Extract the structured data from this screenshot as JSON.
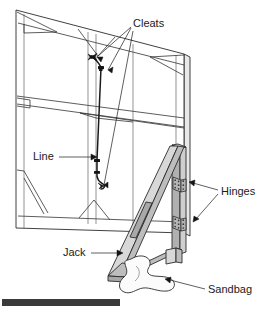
{
  "figure": {
    "type": "isometric-technical-illustration",
    "background_color": "#ffffff",
    "line_color": "#1a1a1a"
  },
  "labels": {
    "cleats": "Cleats",
    "line": "Line",
    "hinges": "Hinges",
    "jack": "Jack",
    "sandbag": "Sandbag"
  },
  "callouts": [
    {
      "id": "cleats",
      "text": "Cleats",
      "text_x": 133,
      "text_y": 24,
      "leader_count": 3,
      "points_to": [
        "upper-cleat",
        "mid-cleat",
        "lower-cleat"
      ]
    },
    {
      "id": "line",
      "text": "Line",
      "text_x": 33,
      "text_y": 157,
      "leader_count": 1,
      "points_to": [
        "rope"
      ]
    },
    {
      "id": "hinges",
      "text": "Hinges",
      "text_x": 221,
      "text_y": 192,
      "leader_count": 2,
      "points_to": [
        "upper-hinge",
        "lower-hinge"
      ]
    },
    {
      "id": "jack",
      "text": "Jack",
      "text_x": 63,
      "text_y": 253,
      "leader_count": 1,
      "points_to": [
        "jack-brace"
      ]
    },
    {
      "id": "sandbag",
      "text": "Sandbag",
      "text_x": 208,
      "text_y": 290,
      "leader_count": 1,
      "points_to": [
        "sandbag-blob"
      ]
    }
  ],
  "parts": {
    "wall_panel": {
      "name": "wall panel",
      "fill": "#ffffff",
      "stroke": "#2b2b2b"
    },
    "jack_brace": {
      "name": "jack brace",
      "fill": "#d8d8d8",
      "stroke": "#2b2b2b"
    },
    "hinge_post": {
      "name": "hinge post",
      "fill": "#cfcfcf",
      "stroke": "#2b2b2b"
    },
    "hinges": {
      "name": "hinges",
      "count": 2,
      "fill": "#b5b5b5",
      "holes_per_hinge": 6
    },
    "cleats": {
      "name": "cleats",
      "count": 3,
      "fill": "#141414"
    },
    "line": {
      "name": "line",
      "stroke": "#1a1a1a"
    },
    "sandbag": {
      "name": "sandbag",
      "fill": "#fbfbfb",
      "stroke": "#2b2b2b"
    }
  },
  "bottom_bar": {
    "name": "scale-bar",
    "color": "#3a3a3a",
    "x": 2,
    "y": 299,
    "width": 118,
    "height": 7
  }
}
